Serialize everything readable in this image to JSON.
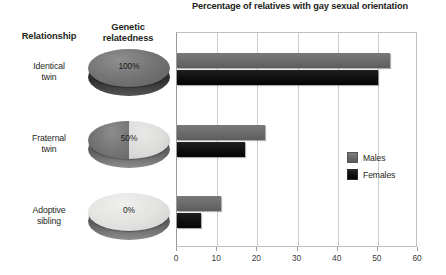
{
  "chart_data": {
    "type": "bar",
    "title": "Percentage of relatives with gay sexual orientation",
    "orientation": "horizontal",
    "xlabel": "",
    "ylabel": "",
    "xlim": [
      0,
      60
    ],
    "xticks": [
      0,
      10,
      20,
      30,
      40,
      50,
      60
    ],
    "grid": true,
    "legend_position": "right-middle",
    "categories": [
      "Identical twin",
      "Fraternal twin",
      "Adoptive sibling"
    ],
    "series": [
      {
        "name": "Males",
        "values": [
          53,
          22,
          11
        ],
        "color": "#6e6e6e"
      },
      {
        "name": "Females",
        "values": [
          50,
          17,
          6
        ],
        "color": "#111111"
      }
    ]
  },
  "headers": {
    "relationship": "Relationship",
    "relatedness_line1": "Genetic",
    "relatedness_line2": "relatedness"
  },
  "rows": [
    {
      "relationship_line1": "Identical",
      "relationship_line2": "twin",
      "relatedness_label": "100%",
      "relatedness_value": 100,
      "disc_style": "full"
    },
    {
      "relationship_line1": "Fraternal",
      "relationship_line2": "twin",
      "relatedness_label": "50%",
      "relatedness_value": 50,
      "disc_style": "half"
    },
    {
      "relationship_line1": "Adoptive",
      "relationship_line2": "sibling",
      "relatedness_label": "0%",
      "relatedness_value": 0,
      "disc_style": "empty"
    }
  ],
  "legend": [
    {
      "label": "Males"
    },
    {
      "label": "Females"
    }
  ],
  "axis": {
    "labels": [
      "0",
      "10",
      "20",
      "30",
      "40",
      "50",
      "60"
    ]
  },
  "colors": {
    "males": "#6e6e6e",
    "females": "#111111",
    "grid": "#cccccc",
    "text": "#231f20"
  }
}
